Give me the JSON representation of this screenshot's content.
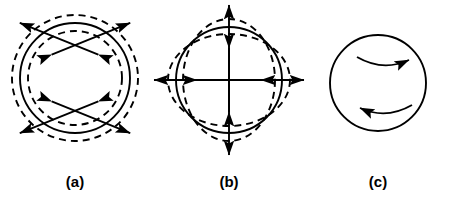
{
  "figure": {
    "width": 453,
    "height": 204,
    "background_color": "#ffffff",
    "stroke_color": "#000000"
  },
  "panels": [
    {
      "id": "a",
      "label": "(a)",
      "mode_name": "radial breathing mode",
      "center": {
        "x": 75,
        "y": 78
      },
      "equilibrium_circle": {
        "radius": 55,
        "style": "solid"
      },
      "deformed_outlines": [
        {
          "radius": 63,
          "style": "dashed",
          "role": "expanded"
        },
        {
          "radius": 47,
          "style": "dashed",
          "role": "contracted"
        }
      ],
      "arrows": {
        "kind": "double-headed-radial",
        "count": 4,
        "angles_deg": [
          45,
          135,
          225,
          315
        ],
        "inner_radius": 33,
        "outer_radius": 78
      }
    },
    {
      "id": "b",
      "label": "(b)",
      "mode_name": "quadrupole spheroidal mode",
      "center": {
        "x": 229,
        "y": 80
      },
      "equilibrium_circle": {
        "radius": 53,
        "style": "solid"
      },
      "deformed_outlines": [
        {
          "rx": 46,
          "ry": 61,
          "style": "dashed",
          "role": "prolate-vertical"
        },
        {
          "rx": 61,
          "ry": 46,
          "style": "dashed",
          "role": "oblate-horizontal"
        }
      ],
      "arrows": {
        "kind": "double-headed-axial",
        "count": 4,
        "angles_deg": [
          0,
          90,
          180,
          270
        ],
        "inner_radius": 32,
        "outer_radius": 75
      }
    },
    {
      "id": "c",
      "label": "(c)",
      "mode_name": "toroidal twisting mode",
      "center": {
        "x": 378,
        "y": 83
      },
      "equilibrium_circle": {
        "radius": 48,
        "style": "solid"
      },
      "deformed_outlines": [],
      "arrows": {
        "kind": "curved-shear",
        "count": 2,
        "upper": {
          "direction": "right",
          "x_start": 357,
          "x_end": 409,
          "y": 61
        },
        "lower": {
          "direction": "left",
          "x_start": 412,
          "x_end": 358,
          "y": 109
        }
      }
    }
  ],
  "labels": {
    "a": "(a)",
    "b": "(b)",
    "c": "(c)"
  }
}
